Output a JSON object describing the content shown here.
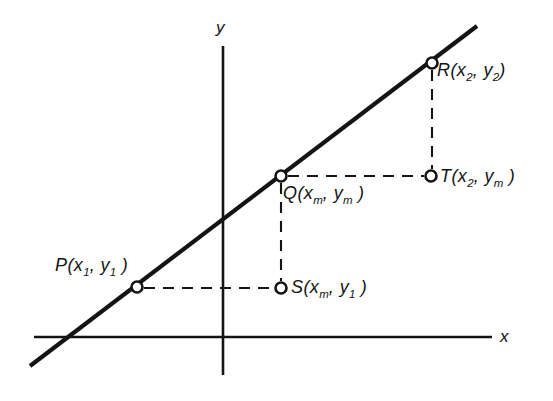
{
  "figure": {
    "kind": "coordinate-geometry-diagram",
    "stroke_color": "#141414",
    "background_color": "#ffffff"
  },
  "axes": {
    "x_axis_label": "x",
    "y_axis_label": "y",
    "x_axis": {
      "x1": 34,
      "y1": 337,
      "x2": 492,
      "y2": 337
    },
    "y_axis": {
      "x1": 223,
      "y1": 46,
      "x2": 223,
      "y2": 375
    }
  },
  "line": {
    "name": "PR",
    "x1": 30,
    "y1": 366,
    "x2": 477,
    "y2": 26,
    "stroke_width": 4
  },
  "points": [
    {
      "id": "P",
      "label_letter": "P",
      "label_text": "P(x1, y1)",
      "coord_x_text": "x",
      "coord_x_sub": "1",
      "coord_y_text": "y",
      "coord_y_sub": "1",
      "cx": 137,
      "cy": 287,
      "on_line": true
    },
    {
      "id": "Q",
      "label_letter": "Q",
      "label_text": "Q(xm, ym)",
      "coord_x_text": "x",
      "coord_x_sub": "m",
      "coord_y_text": "y",
      "coord_y_sub": "m",
      "cx": 281,
      "cy": 176,
      "on_line": true
    },
    {
      "id": "R",
      "label_letter": "R",
      "label_text": "R(x2, y2)",
      "coord_x_text": "x",
      "coord_x_sub": "2",
      "coord_y_text": "y",
      "coord_y_sub": "2",
      "cx": 432,
      "cy": 63,
      "on_line": true
    },
    {
      "id": "S",
      "label_letter": "S",
      "label_text": "S(xm, y1)",
      "coord_x_text": "x",
      "coord_x_sub": "m",
      "coord_y_text": "y",
      "coord_y_sub": "1",
      "cx": 281,
      "cy": 288,
      "on_line": false
    },
    {
      "id": "T",
      "label_letter": "T",
      "label_text": "T(x2, ym)",
      "coord_x_text": "x",
      "coord_x_sub": "2",
      "coord_y_text": "y",
      "coord_y_sub": "m",
      "cx": 431,
      "cy": 176,
      "on_line": false
    }
  ],
  "dashed_segments": [
    {
      "id": "P-to-S",
      "x1": 144,
      "y1": 288,
      "x2": 275,
      "y2": 288,
      "orientation": "horizontal"
    },
    {
      "id": "Q-to-S",
      "x1": 281,
      "y1": 183,
      "x2": 281,
      "y2": 281,
      "orientation": "vertical"
    },
    {
      "id": "Q-to-T",
      "x1": 288,
      "y1": 176,
      "x2": 424,
      "y2": 176,
      "orientation": "horizontal"
    },
    {
      "id": "R-to-T",
      "x1": 432,
      "y1": 70,
      "x2": 432,
      "y2": 169,
      "orientation": "vertical"
    }
  ],
  "marker": {
    "radius": 5.5,
    "fill": "#ffffff",
    "stroke_width": 2.6
  }
}
